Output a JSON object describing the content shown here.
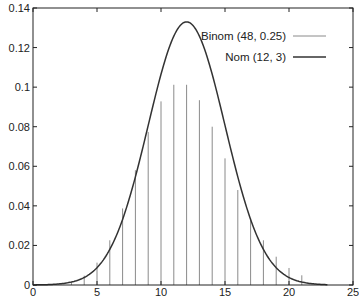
{
  "chart_data": {
    "type": "line",
    "title": "",
    "xlabel": "",
    "ylabel": "",
    "xlim": [
      0,
      25
    ],
    "ylim": [
      0,
      0.14
    ],
    "x_ticks": [
      0,
      5,
      10,
      15,
      20,
      25
    ],
    "x_tick_labels": [
      "0",
      "5",
      "10",
      "15",
      "20",
      "25"
    ],
    "y_ticks": [
      0,
      0.02,
      0.04,
      0.06,
      0.08,
      0.1,
      0.12,
      0.14
    ],
    "y_tick_labels": [
      "0",
      "0.02",
      "0.04",
      "0.06",
      "0.08",
      "0.1",
      "0.12",
      "0.14"
    ],
    "grid": false,
    "legend_position": "upper right",
    "series": [
      {
        "name": "Binom (48, 0.25)",
        "style": "impulses",
        "color": "#8a8a8a",
        "x": [
          3,
          4,
          5,
          6,
          7,
          8,
          9,
          10,
          11,
          12,
          13,
          14,
          15,
          16,
          17,
          18,
          19,
          20,
          21
        ],
        "values": [
          0.0016,
          0.0047,
          0.0113,
          0.0226,
          0.0387,
          0.058,
          0.0773,
          0.0928,
          0.1012,
          0.1012,
          0.0934,
          0.08,
          0.064,
          0.048,
          0.0339,
          0.0226,
          0.0143,
          0.0086,
          0.0049
        ]
      },
      {
        "name": "Nom (12, 3)",
        "style": "line",
        "color": "#333333",
        "mu": 12,
        "sigma": 3,
        "x_range": [
          0,
          23
        ],
        "x": [
          0,
          2,
          4,
          6,
          8,
          10,
          12,
          14,
          16,
          18,
          20,
          22,
          23
        ],
        "values": [
          0.0,
          0.0005,
          0.0038,
          0.018,
          0.0547,
          0.1065,
          0.133,
          0.1065,
          0.0547,
          0.018,
          0.0038,
          0.0005,
          0.0002
        ]
      }
    ]
  },
  "legend": {
    "items": [
      {
        "label": "Binom (48, 0.25)"
      },
      {
        "label": "Nom (12, 3)"
      }
    ]
  }
}
